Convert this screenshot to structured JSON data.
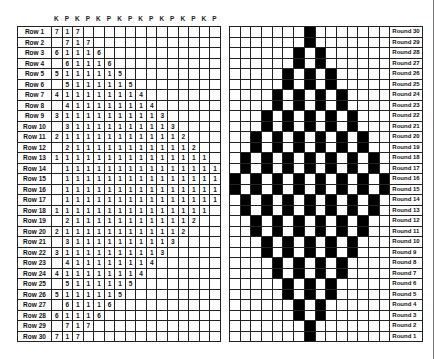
{
  "written_pattern": {
    "column_headers": [
      "K",
      "P",
      "K",
      "P",
      "K",
      "P",
      "K",
      "P",
      "K",
      "P",
      "K",
      "P",
      "K",
      "P",
      "K",
      "P"
    ],
    "rows": [
      {
        "label": "Row 1",
        "start": 1,
        "values": [
          "7",
          "1",
          "7"
        ]
      },
      {
        "label": "Row 2",
        "start": 2,
        "values": [
          "7",
          "1",
          "7"
        ]
      },
      {
        "label": "Row 3",
        "start": 1,
        "values": [
          "6",
          "1",
          "1",
          "1",
          "6"
        ]
      },
      {
        "label": "Row 4",
        "start": 2,
        "values": [
          "6",
          "1",
          "1",
          "1",
          "6"
        ]
      },
      {
        "label": "Row 5",
        "start": 1,
        "values": [
          "5",
          "1",
          "1",
          "1",
          "1",
          "1",
          "5"
        ]
      },
      {
        "label": "Row 6",
        "start": 2,
        "values": [
          "5",
          "1",
          "1",
          "1",
          "1",
          "1",
          "5"
        ]
      },
      {
        "label": "Row 7",
        "start": 1,
        "values": [
          "4",
          "1",
          "1",
          "1",
          "1",
          "1",
          "1",
          "1",
          "4"
        ]
      },
      {
        "label": "Row 8",
        "start": 2,
        "values": [
          "4",
          "1",
          "1",
          "1",
          "1",
          "1",
          "1",
          "1",
          "4"
        ]
      },
      {
        "label": "Row 9",
        "start": 1,
        "values": [
          "3",
          "1",
          "1",
          "1",
          "1",
          "1",
          "1",
          "1",
          "1",
          "1",
          "3"
        ]
      },
      {
        "label": "Row 10",
        "start": 2,
        "values": [
          "3",
          "1",
          "1",
          "1",
          "1",
          "1",
          "1",
          "1",
          "1",
          "1",
          "3"
        ]
      },
      {
        "label": "Row 11",
        "start": 1,
        "values": [
          "2",
          "1",
          "1",
          "1",
          "1",
          "1",
          "1",
          "1",
          "1",
          "1",
          "1",
          "1",
          "2"
        ]
      },
      {
        "label": "Row 12",
        "start": 2,
        "values": [
          "2",
          "1",
          "1",
          "1",
          "1",
          "1",
          "1",
          "1",
          "1",
          "1",
          "1",
          "1",
          "2"
        ]
      },
      {
        "label": "Row 13",
        "start": 1,
        "values": [
          "1",
          "1",
          "1",
          "1",
          "1",
          "1",
          "1",
          "1",
          "1",
          "1",
          "1",
          "1",
          "1",
          "1",
          "1"
        ]
      },
      {
        "label": "Row 14",
        "start": 2,
        "values": [
          "1",
          "1",
          "1",
          "1",
          "1",
          "1",
          "1",
          "1",
          "1",
          "1",
          "1",
          "1",
          "1",
          "1",
          "1"
        ]
      },
      {
        "label": "Row 15",
        "start": 2,
        "values": [
          "1",
          "1",
          "1",
          "1",
          "1",
          "1",
          "1",
          "1",
          "1",
          "1",
          "1",
          "1",
          "1",
          "1",
          "1"
        ]
      },
      {
        "label": "Row 16",
        "start": 2,
        "values": [
          "1",
          "1",
          "1",
          "1",
          "1",
          "1",
          "1",
          "1",
          "1",
          "1",
          "1",
          "1",
          "1",
          "1",
          "1"
        ]
      },
      {
        "label": "Row 17",
        "start": 2,
        "values": [
          "1",
          "1",
          "1",
          "1",
          "1",
          "1",
          "1",
          "1",
          "1",
          "1",
          "1",
          "1",
          "1",
          "1",
          "1"
        ]
      },
      {
        "label": "Row 18",
        "start": 1,
        "values": [
          "1",
          "1",
          "1",
          "1",
          "1",
          "1",
          "1",
          "1",
          "1",
          "1",
          "1",
          "1",
          "1",
          "1",
          "1"
        ]
      },
      {
        "label": "Row 19",
        "start": 2,
        "values": [
          "2",
          "1",
          "1",
          "1",
          "1",
          "1",
          "1",
          "1",
          "1",
          "1",
          "1",
          "1",
          "2"
        ]
      },
      {
        "label": "Row 20",
        "start": 1,
        "values": [
          "2",
          "1",
          "1",
          "1",
          "1",
          "1",
          "1",
          "1",
          "1",
          "1",
          "1",
          "1",
          "2"
        ]
      },
      {
        "label": "Row 21",
        "start": 2,
        "values": [
          "3",
          "1",
          "1",
          "1",
          "1",
          "1",
          "1",
          "1",
          "1",
          "1",
          "3"
        ]
      },
      {
        "label": "Row 22",
        "start": 1,
        "values": [
          "3",
          "1",
          "1",
          "1",
          "1",
          "1",
          "1",
          "1",
          "1",
          "1",
          "3"
        ]
      },
      {
        "label": "Row 23",
        "start": 2,
        "values": [
          "4",
          "1",
          "1",
          "1",
          "1",
          "1",
          "1",
          "1",
          "4"
        ]
      },
      {
        "label": "Row 24",
        "start": 1,
        "values": [
          "4",
          "1",
          "1",
          "1",
          "1",
          "1",
          "1",
          "1",
          "4"
        ]
      },
      {
        "label": "Row 25",
        "start": 2,
        "values": [
          "5",
          "1",
          "1",
          "1",
          "1",
          "1",
          "5"
        ]
      },
      {
        "label": "Row 26",
        "start": 1,
        "values": [
          "5",
          "1",
          "1",
          "1",
          "1",
          "1",
          "5"
        ]
      },
      {
        "label": "Row 27",
        "start": 2,
        "values": [
          "6",
          "1",
          "1",
          "1",
          "6"
        ]
      },
      {
        "label": "Row 28",
        "start": 1,
        "values": [
          "6",
          "1",
          "1",
          "1",
          "6"
        ]
      },
      {
        "label": "Row 29",
        "start": 2,
        "values": [
          "7",
          "1",
          "7"
        ]
      },
      {
        "label": "Row 30",
        "start": 1,
        "values": [
          "7",
          "1",
          "7"
        ]
      }
    ]
  },
  "chart": {
    "columns": 15,
    "fill_color": "#000000",
    "rounds": [
      {
        "label": "Round 30",
        "black": [
          7
        ]
      },
      {
        "label": "Round 29",
        "black": [
          7
        ]
      },
      {
        "label": "Round 28",
        "black": [
          6,
          8
        ]
      },
      {
        "label": "Round 27",
        "black": [
          6,
          8
        ]
      },
      {
        "label": "Round 26",
        "black": [
          5,
          7,
          9
        ]
      },
      {
        "label": "Round 25",
        "black": [
          5,
          7,
          9
        ]
      },
      {
        "label": "Round 24",
        "black": [
          4,
          6,
          8,
          10
        ]
      },
      {
        "label": "Round 23",
        "black": [
          4,
          6,
          8,
          10
        ]
      },
      {
        "label": "Round 22",
        "black": [
          3,
          5,
          7,
          9,
          11
        ]
      },
      {
        "label": "Round 21",
        "black": [
          3,
          5,
          7,
          9,
          11
        ]
      },
      {
        "label": "Round 20",
        "black": [
          2,
          4,
          6,
          8,
          10,
          12
        ]
      },
      {
        "label": "Round 19",
        "black": [
          2,
          4,
          6,
          8,
          10,
          12
        ]
      },
      {
        "label": "Round 18",
        "black": [
          1,
          3,
          5,
          7,
          9,
          11,
          13
        ]
      },
      {
        "label": "Round 17",
        "black": [
          1,
          3,
          5,
          7,
          9,
          11,
          13
        ]
      },
      {
        "label": "Round 16",
        "black": [
          0,
          2,
          4,
          6,
          8,
          10,
          12,
          14
        ]
      },
      {
        "label": "Round 15",
        "black": [
          0,
          2,
          4,
          6,
          8,
          10,
          12,
          14
        ]
      },
      {
        "label": "Round 14",
        "black": [
          1,
          3,
          5,
          7,
          9,
          11,
          13
        ]
      },
      {
        "label": "Round 13",
        "black": [
          1,
          3,
          5,
          7,
          9,
          11,
          13
        ]
      },
      {
        "label": "Round 12",
        "black": [
          2,
          4,
          6,
          8,
          10,
          12
        ]
      },
      {
        "label": "Round 11",
        "black": [
          2,
          4,
          6,
          8,
          10,
          12
        ]
      },
      {
        "label": "Round 10",
        "black": [
          3,
          5,
          7,
          9,
          11
        ]
      },
      {
        "label": "Round 9",
        "black": [
          3,
          5,
          7,
          9,
          11
        ]
      },
      {
        "label": "Round 8",
        "black": [
          4,
          6,
          8,
          10
        ]
      },
      {
        "label": "Round 7",
        "black": [
          4,
          6,
          8,
          10
        ]
      },
      {
        "label": "Round 6",
        "black": [
          5,
          7,
          9
        ]
      },
      {
        "label": "Round 5",
        "black": [
          5,
          7,
          9
        ]
      },
      {
        "label": "Round 4",
        "black": [
          6,
          8
        ]
      },
      {
        "label": "Round 3",
        "black": [
          6,
          8
        ]
      },
      {
        "label": "Round 2",
        "black": [
          7
        ]
      },
      {
        "label": "Round 1",
        "black": [
          7
        ]
      }
    ]
  }
}
